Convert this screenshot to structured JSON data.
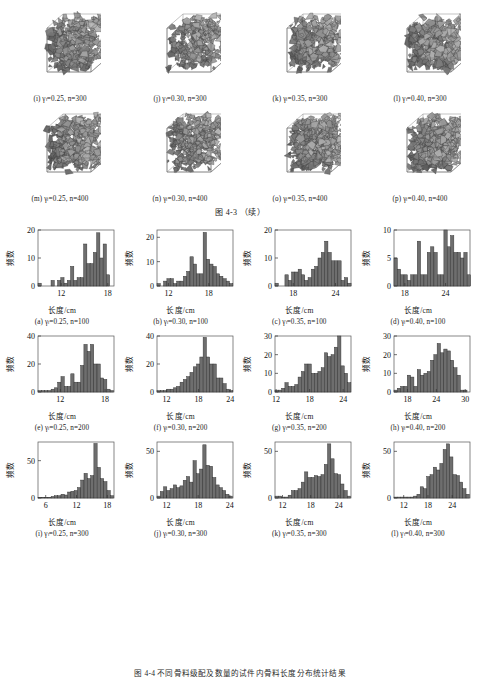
{
  "figure": {
    "middle_caption": "图 4-3 （续）",
    "bottom_caption": "图 4-4  不同骨料级配及数量的试件内骨料长度分布统计结果",
    "axis_x_title": "长度/cm",
    "axis_y_title": "频数",
    "gamma_symbol": "γ",
    "gamma_subscript": "l",
    "n_symbol": "n"
  },
  "cubes": {
    "rows": [
      {
        "panels": [
          {
            "tag": "(i)",
            "gamma": "0.25",
            "n": "300",
            "caption": "(i)  γₗ=0.25, n=300"
          },
          {
            "tag": "(j)",
            "gamma": "0.30",
            "n": "300",
            "caption": "(j)  γₗ=0.30, n=300"
          },
          {
            "tag": "(k)",
            "gamma": "0.35",
            "n": "300",
            "caption": "(k)  γₗ=0.35, n=300"
          },
          {
            "tag": "(l)",
            "gamma": "0.40",
            "n": "300",
            "caption": "(l)  γₗ=0.40, n=300"
          }
        ]
      },
      {
        "panels": [
          {
            "tag": "(m)",
            "gamma": "0.25",
            "n": "400",
            "caption": "(m)  γₗ=0.25, n=400"
          },
          {
            "tag": "(n)",
            "gamma": "0.30",
            "n": "400",
            "caption": "(n)  γₗ=0.30, n=400"
          },
          {
            "tag": "(o)",
            "gamma": "0.35",
            "n": "400",
            "caption": "(o)  γₗ=0.35, n=400"
          },
          {
            "tag": "(p)",
            "gamma": "0.40",
            "n": "400",
            "caption": "(p)  γₗ=0.40, n=400"
          }
        ]
      }
    ]
  },
  "chart_data": [
    {
      "id": "a",
      "type": "bar",
      "tag": "(a)",
      "gamma": "0.25",
      "n": "100",
      "title": "(a) γₗ=0.25, n=100",
      "xlabel": "长度/cm",
      "ylabel": "频数",
      "xlim": [
        9.0,
        18.8
      ],
      "ylim": [
        0,
        20
      ],
      "xticks": [
        12,
        18
      ],
      "yticks": [
        0,
        10,
        20
      ],
      "bin_width": 0.42,
      "bin_starts": [
        9.0,
        9.42,
        9.84,
        10.26,
        10.68,
        11.1,
        11.52,
        11.94,
        12.36,
        12.78,
        13.2,
        13.62,
        14.04,
        14.46,
        14.88,
        15.3,
        15.72,
        16.14,
        16.56,
        16.98,
        17.4,
        17.82,
        18.24
      ],
      "values": [
        1,
        0,
        0,
        0,
        2,
        0,
        2,
        3,
        1,
        2,
        7,
        2,
        3,
        3,
        15,
        8,
        8,
        12,
        19,
        10,
        15,
        4,
        0
      ]
    },
    {
      "id": "b",
      "type": "bar",
      "tag": "(b)",
      "gamma": "0.30",
      "n": "100",
      "title": "(b) γₗ=0.30, n=100",
      "xlabel": "长度/cm",
      "ylabel": "频数",
      "xlim": [
        10.3,
        21.6
      ],
      "ylim": [
        0,
        23
      ],
      "xticks": [
        12,
        18
      ],
      "yticks": [
        0,
        10,
        20
      ],
      "bin_width": 0.49,
      "bin_starts": [
        10.3,
        10.79,
        11.28,
        11.77,
        12.26,
        12.75,
        13.24,
        13.73,
        14.22,
        14.71,
        15.2,
        15.69,
        16.18,
        16.67,
        17.16,
        17.65,
        18.14,
        18.63,
        19.12,
        19.61,
        20.1,
        20.59,
        21.08
      ],
      "values": [
        1,
        0,
        2,
        3,
        3,
        1,
        2,
        2,
        4,
        6,
        12,
        9,
        5,
        5,
        22,
        11,
        9,
        8,
        5,
        4,
        3,
        2,
        1
      ]
    },
    {
      "id": "c",
      "type": "bar",
      "tag": "(c)",
      "gamma": "0.35",
      "n": "100",
      "title": "(c) γₗ=0.35, n=100",
      "xlabel": "长度/cm",
      "ylabel": "频数",
      "xlim": [
        15.4,
        26.2
      ],
      "ylim": [
        0,
        20
      ],
      "xticks": [
        18,
        24
      ],
      "yticks": [
        0,
        10,
        20
      ],
      "bin_width": 0.47,
      "bin_starts": [
        15.4,
        15.87,
        16.34,
        16.81,
        17.28,
        17.75,
        18.22,
        18.69,
        19.16,
        19.63,
        20.1,
        20.57,
        21.04,
        21.51,
        21.98,
        22.45,
        22.92,
        23.39,
        23.86,
        24.33,
        24.8,
        25.27,
        25.74
      ],
      "values": [
        1,
        0,
        0,
        4,
        2,
        5,
        5,
        6,
        4,
        2,
        3,
        6,
        7,
        10,
        12,
        16,
        12,
        9,
        9,
        9,
        2,
        3,
        1
      ]
    },
    {
      "id": "d",
      "type": "bar",
      "tag": "(d)",
      "gamma": "0.40",
      "n": "100",
      "title": "(d) γₗ=0.40, n=100",
      "xlabel": "长度/cm",
      "ylabel": "频数",
      "xlim": [
        16.4,
        27.6
      ],
      "ylim": [
        0,
        10
      ],
      "xticks": [
        18,
        24
      ],
      "yticks": [
        0,
        5,
        10
      ],
      "bin_width": 0.49,
      "bin_starts": [
        16.4,
        16.89,
        17.38,
        17.87,
        18.36,
        18.85,
        19.34,
        19.83,
        20.32,
        20.81,
        21.3,
        21.79,
        22.28,
        22.77,
        23.26,
        23.75,
        24.24,
        24.73,
        25.22,
        25.71,
        26.2,
        26.69,
        27.18
      ],
      "values": [
        5,
        3,
        2,
        2,
        1,
        2,
        2,
        8,
        2,
        2,
        6,
        7,
        6,
        2,
        2,
        10,
        7,
        9,
        6,
        6,
        5,
        6,
        2
      ]
    },
    {
      "id": "e",
      "type": "bar",
      "tag": "(e)",
      "gamma": "0.25",
      "n": "200",
      "title": "(e) γₗ=0.25, n=200",
      "xlabel": "长度/cm",
      "ylabel": "频数",
      "xlim": [
        9.0,
        19.2
      ],
      "ylim": [
        0,
        40
      ],
      "xticks": [
        12,
        18
      ],
      "yticks": [
        0,
        20,
        40
      ],
      "bin_width": 0.44,
      "bin_starts": [
        9.0,
        9.44,
        9.88,
        10.32,
        10.76,
        11.2,
        11.64,
        12.08,
        12.52,
        12.96,
        13.4,
        13.84,
        14.28,
        14.72,
        15.16,
        15.6,
        16.04,
        16.48,
        16.92,
        17.36,
        17.8,
        18.24,
        18.68
      ],
      "values": [
        1,
        1,
        1,
        1,
        2,
        3,
        7,
        11,
        4,
        4,
        13,
        7,
        7,
        19,
        34,
        29,
        34,
        20,
        20,
        10,
        9,
        2,
        1
      ]
    },
    {
      "id": "f",
      "type": "bar",
      "tag": "(f)",
      "gamma": "0.30",
      "n": "200",
      "title": "(f) γₗ=0.30, n=200",
      "xlabel": "长度/cm",
      "ylabel": "频数",
      "xlim": [
        10.2,
        24.5
      ],
      "ylim": [
        0,
        40
      ],
      "xticks": [
        12,
        18,
        24
      ],
      "yticks": [
        0,
        20,
        40
      ],
      "bin_width": 0.62,
      "bin_starts": [
        10.2,
        10.82,
        11.44,
        12.06,
        12.68,
        13.3,
        13.92,
        14.54,
        15.16,
        15.78,
        16.4,
        17.02,
        17.64,
        18.26,
        18.88,
        19.5,
        20.12,
        20.74,
        21.36,
        21.98,
        22.6,
        23.22,
        23.84
      ],
      "values": [
        1,
        1,
        1,
        2,
        2,
        3,
        4,
        7,
        9,
        11,
        14,
        18,
        20,
        25,
        39,
        25,
        20,
        20,
        10,
        10,
        6,
        2,
        1
      ]
    },
    {
      "id": "g",
      "type": "bar",
      "tag": "(g)",
      "gamma": "0.35",
      "n": "200",
      "title": "(g) γₗ=0.35, n=200",
      "xlabel": "长度/cm",
      "ylabel": "频数",
      "xlim": [
        11.8,
        25.4
      ],
      "ylim": [
        0,
        30
      ],
      "xticks": [
        12,
        18,
        24
      ],
      "yticks": [
        0,
        10,
        20,
        30
      ],
      "bin_width": 0.59,
      "bin_starts": [
        11.8,
        12.39,
        12.98,
        13.57,
        14.16,
        14.75,
        15.34,
        15.93,
        16.52,
        17.11,
        17.7,
        18.29,
        18.88,
        19.47,
        20.06,
        20.65,
        21.24,
        21.83,
        22.42,
        23.01,
        23.6,
        24.19,
        24.78
      ],
      "values": [
        1,
        1,
        2,
        5,
        3,
        3,
        4,
        8,
        11,
        15,
        15,
        10,
        10,
        11,
        13,
        21,
        19,
        20,
        24,
        30,
        14,
        10,
        5
      ]
    },
    {
      "id": "h",
      "type": "bar",
      "tag": "(h)",
      "gamma": "0.40",
      "n": "200",
      "title": "(h) γₗ=0.40, n=200",
      "xlabel": "长度/cm",
      "ylabel": "频数",
      "xlim": [
        15.2,
        31.0
      ],
      "ylim": [
        0,
        30
      ],
      "xticks": [
        18,
        24,
        30
      ],
      "yticks": [
        0,
        10,
        20,
        30
      ],
      "bin_width": 0.69,
      "bin_starts": [
        15.2,
        15.89,
        16.58,
        17.27,
        17.96,
        18.65,
        19.34,
        20.03,
        20.72,
        21.41,
        22.1,
        22.79,
        23.48,
        24.17,
        24.86,
        25.55,
        26.24,
        26.93,
        27.62,
        28.31,
        29.0,
        29.69,
        30.38
      ],
      "values": [
        1,
        2,
        3,
        3,
        9,
        8,
        3,
        12,
        9,
        10,
        11,
        17,
        20,
        26,
        21,
        23,
        22,
        17,
        13,
        9,
        1,
        1,
        0
      ]
    },
    {
      "id": "i",
      "type": "bar",
      "tag": "(i)",
      "gamma": "0.25",
      "n": "300",
      "title": "(i) γₗ=0.25, n=300",
      "xlabel": "长度/cm",
      "ylabel": "频数",
      "xlim": [
        4.5,
        19.3
      ],
      "ylim": [
        0,
        75
      ],
      "xticks": [
        6,
        12,
        18
      ],
      "yticks": [
        0,
        50
      ],
      "bin_width": 0.64,
      "bin_starts": [
        4.5,
        5.14,
        5.78,
        6.42,
        7.06,
        7.7,
        8.34,
        8.98,
        9.62,
        10.26,
        10.9,
        11.54,
        12.18,
        12.82,
        13.46,
        14.1,
        14.74,
        15.38,
        16.02,
        16.66,
        17.3,
        17.94,
        18.58
      ],
      "values": [
        1,
        1,
        1,
        1,
        2,
        3,
        3,
        5,
        4,
        8,
        9,
        10,
        14,
        24,
        33,
        26,
        30,
        73,
        41,
        26,
        22,
        10,
        3
      ]
    },
    {
      "id": "j",
      "type": "bar",
      "tag": "(j)",
      "gamma": "0.30",
      "n": "300",
      "title": "(j) γₗ=0.30, n=300",
      "xlabel": "长度/cm",
      "ylabel": "频数",
      "xlim": [
        10.2,
        24.6
      ],
      "ylim": [
        0,
        60
      ],
      "xticks": [
        12,
        18,
        24
      ],
      "yticks": [
        0,
        50
      ],
      "bin_width": 0.62,
      "bin_starts": [
        10.2,
        10.82,
        11.44,
        12.06,
        12.68,
        13.3,
        13.92,
        14.54,
        15.16,
        15.78,
        16.4,
        17.02,
        17.64,
        18.26,
        18.88,
        19.5,
        20.12,
        20.74,
        21.36,
        21.98,
        22.6,
        23.22,
        23.84
      ],
      "values": [
        2,
        7,
        12,
        8,
        10,
        14,
        11,
        13,
        19,
        23,
        17,
        40,
        26,
        31,
        57,
        35,
        34,
        22,
        14,
        11,
        8,
        4,
        2
      ]
    },
    {
      "id": "k",
      "type": "bar",
      "tag": "(k)",
      "gamma": "0.35",
      "n": "300",
      "title": "(k) γₗ=0.35, n=300",
      "xlabel": "长度/cm",
      "ylabel": "频数",
      "xlim": [
        10.4,
        26.6
      ],
      "ylim": [
        0,
        60
      ],
      "xticks": [
        12,
        18,
        24
      ],
      "yticks": [
        0,
        50
      ],
      "bin_width": 0.7,
      "bin_starts": [
        10.4,
        11.1,
        11.8,
        12.5,
        13.2,
        13.9,
        14.6,
        15.3,
        16.0,
        16.7,
        17.4,
        18.1,
        18.8,
        19.5,
        20.2,
        20.9,
        21.6,
        22.3,
        23.0,
        23.7,
        24.4,
        25.1,
        25.8
      ],
      "values": [
        2,
        2,
        1,
        1,
        3,
        8,
        8,
        10,
        17,
        28,
        22,
        22,
        24,
        23,
        25,
        36,
        58,
        42,
        26,
        25,
        15,
        8,
        2
      ]
    },
    {
      "id": "l",
      "type": "bar",
      "tag": "(l)",
      "gamma": "0.40",
      "n": "300",
      "title": "(l) γₗ=0.40, n=300",
      "xlabel": "长度/cm",
      "ylabel": "频数",
      "xlim": [
        9.6,
        28.4
      ],
      "ylim": [
        0,
        60
      ],
      "xticks": [
        12,
        18,
        24
      ],
      "yticks": [
        0,
        50
      ],
      "bin_width": 0.81,
      "bin_starts": [
        9.6,
        10.41,
        11.22,
        12.03,
        12.84,
        13.65,
        14.46,
        15.27,
        16.08,
        16.89,
        17.7,
        18.51,
        19.32,
        20.13,
        20.94,
        21.75,
        22.56,
        23.37,
        24.18,
        24.99,
        25.8,
        26.61,
        27.42
      ],
      "values": [
        1,
        1,
        1,
        1,
        1,
        1,
        2,
        4,
        12,
        10,
        23,
        25,
        33,
        30,
        37,
        52,
        58,
        44,
        25,
        24,
        17,
        10,
        4
      ]
    }
  ]
}
